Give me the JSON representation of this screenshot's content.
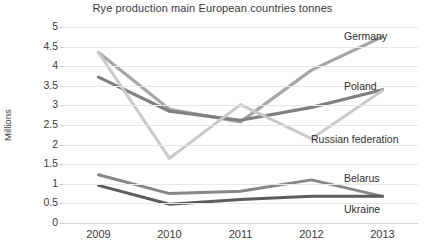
{
  "chart_data": {
    "type": "line",
    "title": "Rye production main European countries tonnes",
    "xlabel": "",
    "ylabel": "Millions",
    "categories": [
      "2009",
      "2010",
      "2011",
      "2012",
      "2013"
    ],
    "x": [
      2009,
      2010,
      2011,
      2012,
      2013
    ],
    "ylim": [
      0,
      5
    ],
    "yticks": [
      "0",
      "0.5",
      "1",
      "1.5",
      "2",
      "2.5",
      "3",
      "3.5",
      "4",
      "4.5",
      "5"
    ],
    "ytick_values": [
      0,
      0.5,
      1,
      1.5,
      2,
      2.5,
      3,
      3.5,
      4,
      4.5,
      5
    ],
    "grid": true,
    "legend_position": "inline-right-labels",
    "series": [
      {
        "name": "Germany",
        "color": "#a6a6a6",
        "width": 3.2,
        "values": [
          4.35,
          2.9,
          2.58,
          3.9,
          4.75
        ],
        "label_x": 344,
        "label_y": 30
      },
      {
        "name": "Poland",
        "color": "#808080",
        "width": 3.2,
        "values": [
          3.72,
          2.85,
          2.62,
          2.95,
          3.4
        ],
        "label_x": 344,
        "label_y": 80
      },
      {
        "name": "Russian federation",
        "color": "#c9c9c9",
        "width": 3.0,
        "values": [
          4.35,
          1.65,
          3.02,
          2.15,
          3.38
        ],
        "label_x": 311,
        "label_y": 133
      },
      {
        "name": "Belarus",
        "color": "#878787",
        "width": 3.0,
        "values": [
          1.23,
          0.75,
          0.81,
          1.1,
          0.68
        ],
        "label_x": 344,
        "label_y": 172
      },
      {
        "name": "Ukraine",
        "color": "#5c5c5c",
        "width": 3.0,
        "values": [
          0.96,
          0.48,
          0.6,
          0.68,
          0.68
        ],
        "label_x": 344,
        "label_y": 203
      }
    ]
  }
}
